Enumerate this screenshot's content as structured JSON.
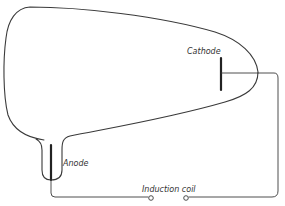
{
  "diagram": {
    "labels": {
      "cathode": "Cathode",
      "anode": "Anode",
      "induction_coil": "Induction coil"
    },
    "components": [
      {
        "id": "tube",
        "type": "glass-tube-outline"
      },
      {
        "id": "cathode",
        "type": "electrode",
        "label": "Cathode"
      },
      {
        "id": "anode",
        "type": "electrode",
        "label": "Anode"
      },
      {
        "id": "induction-coil",
        "type": "terminals",
        "label": "Induction coil"
      }
    ],
    "connections": [
      {
        "from": "cathode",
        "to": "induction-coil"
      },
      {
        "from": "anode",
        "to": "induction-coil"
      }
    ],
    "colors": {
      "line": "#3a3a3a",
      "background": "#ffffff"
    }
  }
}
